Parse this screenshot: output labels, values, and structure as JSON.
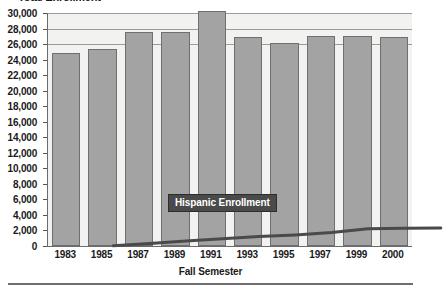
{
  "chart_data": {
    "type": "bar",
    "title": "Total Enrollment",
    "xlabel": "Fall Semester",
    "ylabel": "",
    "categories": [
      "1983",
      "1985",
      "1987",
      "1989",
      "1991",
      "1993",
      "1995",
      "1997",
      "1999",
      "2000"
    ],
    "ylim": [
      0,
      30000
    ],
    "y_ticks": [
      0,
      2000,
      4000,
      6000,
      8000,
      10000,
      12000,
      14000,
      16000,
      18000,
      20000,
      22000,
      24000,
      26000,
      28000,
      30000
    ],
    "y_tick_labels": [
      "0",
      "2,000",
      "4,000",
      "6,000",
      "8,000",
      "10,000",
      "12,000",
      "14,000",
      "16,000",
      "18,000",
      "20,000",
      "22,000",
      "24,000",
      "26,000",
      "28,000",
      "30,000"
    ],
    "gridlines_at": [
      26000,
      28000,
      30000
    ],
    "grid": true,
    "legend_position": "inline-callout",
    "series": [
      {
        "name": "Total Enrollment",
        "type": "bar",
        "color": "#a3a3a3",
        "values": [
          24800,
          25400,
          27500,
          27600,
          30200,
          26900,
          26200,
          27000,
          27000,
          26900
        ]
      },
      {
        "name": "Hispanic Enrollment",
        "type": "line",
        "color": "#4a4a4a",
        "values": [
          1700,
          2000,
          2300,
          2600,
          2900,
          3100,
          3400,
          3900,
          3950,
          4000
        ]
      }
    ],
    "annotations": [
      {
        "text": "Hispanic Enrollment",
        "style": "white-text-on-dark-box"
      }
    ]
  },
  "axis": {
    "x_title": "Fall Semester"
  }
}
